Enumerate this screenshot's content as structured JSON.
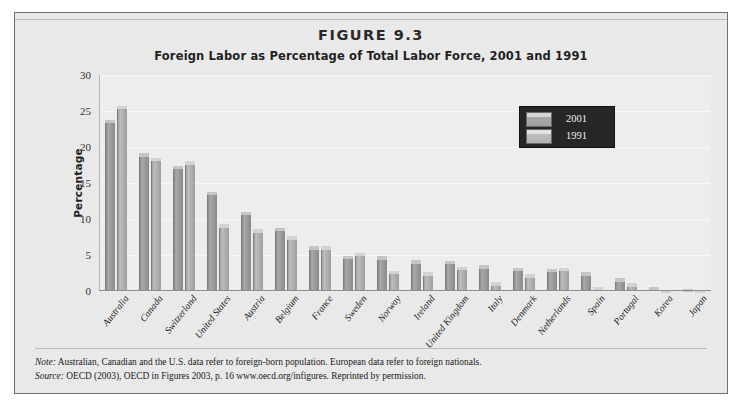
{
  "figure": {
    "number_label": "FIGURE 9.3",
    "title": "Foreign Labor as Percentage of Total Labor Force, 2001 and 1991"
  },
  "legend": {
    "entries": [
      {
        "label": "2001",
        "swatch": "bar-swatch-2001"
      },
      {
        "label": "1991",
        "swatch": "bar-swatch-1991"
      }
    ]
  },
  "footnotes": {
    "note_prefix": "Note:",
    "note_text": " Australian, Canadian and the U.S. data refer to foreign-born population. European data refer to foreign nationals.",
    "source_prefix": "Source:",
    "source_text": " OECD (2003), OECD in Figures 2003, p. 16 www.oecd.org/infigures. Reprinted by permission."
  },
  "chart_data": {
    "type": "bar",
    "title": "Foreign Labor as Percentage of Total Labor Force, 2001 and 1991",
    "xlabel": "",
    "ylabel": "Percentage",
    "ylim": [
      0,
      30
    ],
    "yticks": [
      0,
      5,
      10,
      15,
      20,
      25,
      30
    ],
    "ytick_labels": [
      "0",
      "5",
      "10",
      "15",
      "20",
      "25",
      "30"
    ],
    "grid": true,
    "legend_position": "upper-right",
    "categories": [
      "Australia",
      "Canada",
      "Switzerland",
      "United States",
      "Austria",
      "Belgium",
      "France",
      "Sweden",
      "Norway",
      "Ireland",
      "United Kingdom",
      "Italy",
      "Denmark",
      "Netherlands",
      "Spain",
      "Portugal",
      "Korea",
      "Japan"
    ],
    "series": [
      {
        "name": "2001",
        "values": [
          23.8,
          19.1,
          17.4,
          13.8,
          11.0,
          8.8,
          6.2,
          4.9,
          4.8,
          4.3,
          4.2,
          3.6,
          3.2,
          3.1,
          2.6,
          1.8,
          0.5,
          0.3
        ]
      },
      {
        "name": "1991",
        "values": [
          25.7,
          18.5,
          18.0,
          9.3,
          8.6,
          7.6,
          6.2,
          5.3,
          2.8,
          2.6,
          3.4,
          1.2,
          2.3,
          3.2,
          0.5,
          1.1,
          0.2,
          0.1
        ]
      }
    ]
  }
}
